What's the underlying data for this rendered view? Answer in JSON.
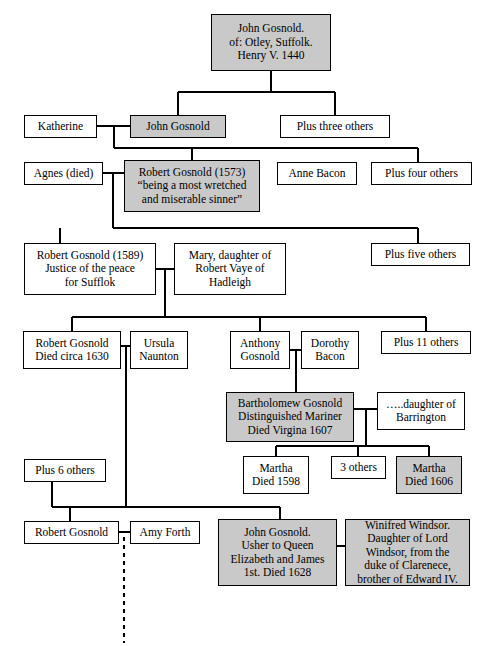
{
  "diagram": {
    "type": "genealogy-tree",
    "shaded_color": "#c9c9c9",
    "plain_color": "#ffffff",
    "line_color": "#000000"
  },
  "nodes": [
    {
      "id": "john-gosnold-1440",
      "name": "john-gosnold-otley-box",
      "lines": [
        "John Gosnold.",
        "of: Otley, Suffolk.",
        "Henry V. 1440"
      ],
      "shaded": true,
      "x": 211,
      "y": 14,
      "w": 120,
      "h": 57
    },
    {
      "id": "katherine",
      "name": "katherine-box",
      "lines": [
        "Katherine"
      ],
      "shaded": false,
      "x": 24,
      "y": 115,
      "w": 73,
      "h": 23
    },
    {
      "id": "john-gosnold-2",
      "name": "john-gosnold-box",
      "lines": [
        "John Gosnold"
      ],
      "shaded": true,
      "x": 130,
      "y": 115,
      "w": 96,
      "h": 23
    },
    {
      "id": "plus-three-others",
      "name": "plus-three-others-box",
      "lines": [
        "Plus three others"
      ],
      "shaded": false,
      "x": 280,
      "y": 115,
      "w": 110,
      "h": 23
    },
    {
      "id": "agnes-died",
      "name": "agnes-died-box",
      "lines": [
        "Agnes (died)"
      ],
      "shaded": false,
      "x": 24,
      "y": 162,
      "w": 79,
      "h": 23
    },
    {
      "id": "robert-gosnold-1573",
      "name": "robert-gosnold-1573-box",
      "lines": [
        "Robert Gosnold (1573)",
        "“being a most wretched",
        "and miserable sinner”"
      ],
      "shaded": true,
      "x": 124,
      "y": 160,
      "w": 136,
      "h": 52
    },
    {
      "id": "anne-bacon",
      "name": "anne-bacon-box",
      "lines": [
        "Anne Bacon"
      ],
      "shaded": false,
      "x": 277,
      "y": 162,
      "w": 80,
      "h": 23
    },
    {
      "id": "plus-four-others",
      "name": "plus-four-others-box",
      "lines": [
        "Plus four others"
      ],
      "shaded": false,
      "x": 371,
      "y": 162,
      "w": 101,
      "h": 23
    },
    {
      "id": "robert-gosnold-1589",
      "name": "robert-gosnold-1589-box",
      "lines": [
        "Robert Gosnold (1589)",
        "Justice of the peace",
        "for Sufflok"
      ],
      "shaded": false,
      "x": 24,
      "y": 243,
      "w": 132,
      "h": 52
    },
    {
      "id": "mary-vaye",
      "name": "mary-daughter-robert-vaye-box",
      "lines": [
        "Mary, daughter of",
        "Robert Vaye of",
        "Hadleigh"
      ],
      "shaded": false,
      "x": 174,
      "y": 243,
      "w": 112,
      "h": 52
    },
    {
      "id": "plus-five-others",
      "name": "plus-five-others-box",
      "lines": [
        "Plus five others"
      ],
      "shaded": false,
      "x": 371,
      "y": 243,
      "w": 99,
      "h": 23
    },
    {
      "id": "robert-gosnold-1630",
      "name": "robert-gosnold-died-circa-1630-box",
      "lines": [
        "Robert Gosnold",
        "Died circa 1630"
      ],
      "shaded": false,
      "x": 23,
      "y": 331,
      "w": 98,
      "h": 38
    },
    {
      "id": "ursula-naunton",
      "name": "ursula-naunton-box",
      "lines": [
        "Ursula",
        "Naunton"
      ],
      "shaded": false,
      "x": 130,
      "y": 331,
      "w": 58,
      "h": 38
    },
    {
      "id": "anthony-gosnold",
      "name": "anthony-gosnold-box",
      "lines": [
        "Anthony",
        "Gosnold"
      ],
      "shaded": false,
      "x": 230,
      "y": 331,
      "w": 60,
      "h": 38
    },
    {
      "id": "dorothy-bacon",
      "name": "dorothy-bacon-box",
      "lines": [
        "Dorothy",
        "Bacon"
      ],
      "shaded": false,
      "x": 301,
      "y": 331,
      "w": 58,
      "h": 38
    },
    {
      "id": "plus-11-others",
      "name": "plus-11-others-box",
      "lines": [
        "Plus 11 others"
      ],
      "shaded": false,
      "x": 381,
      "y": 331,
      "w": 90,
      "h": 23
    },
    {
      "id": "bartholomew-gosnold",
      "name": "bartholomew-gosnold-box",
      "lines": [
        "Bartholomew Gosnold",
        "Distinguished Mariner",
        "Died Virgina 1607"
      ],
      "shaded": true,
      "x": 226,
      "y": 392,
      "w": 128,
      "h": 50
    },
    {
      "id": "daughter-of-barrington",
      "name": "daughter-of-barrington-box",
      "lines": [
        "…..daughter of",
        "Barrington"
      ],
      "shaded": false,
      "x": 377,
      "y": 392,
      "w": 88,
      "h": 38
    },
    {
      "id": "plus-6-others",
      "name": "plus-6-others-box",
      "lines": [
        "Plus 6 others"
      ],
      "shaded": false,
      "x": 24,
      "y": 459,
      "w": 82,
      "h": 23
    },
    {
      "id": "martha-1598",
      "name": "martha-died-1598-box",
      "lines": [
        "Martha",
        "Died 1598"
      ],
      "shaded": false,
      "x": 243,
      "y": 456,
      "w": 66,
      "h": 38
    },
    {
      "id": "three-others",
      "name": "three-others-box",
      "lines": [
        "3 others"
      ],
      "shaded": false,
      "x": 331,
      "y": 456,
      "w": 55,
      "h": 23
    },
    {
      "id": "martha-1606",
      "name": "martha-died-1606-box",
      "lines": [
        "Martha",
        "Died 1606"
      ],
      "shaded": true,
      "x": 396,
      "y": 456,
      "w": 66,
      "h": 38
    },
    {
      "id": "robert-gosnold-bottom",
      "name": "robert-gosnold-bottom-box",
      "lines": [
        "Robert Gosnold"
      ],
      "shaded": false,
      "x": 24,
      "y": 521,
      "w": 95,
      "h": 23
    },
    {
      "id": "amy-forth",
      "name": "amy-forth-box",
      "lines": [
        "Amy Forth"
      ],
      "shaded": false,
      "x": 130,
      "y": 521,
      "w": 70,
      "h": 23
    },
    {
      "id": "john-gosnold-usher",
      "name": "john-gosnold-usher-box",
      "lines": [
        "John Gosnold.",
        "Usher to Queen",
        "Elizabeth and James",
        "1st. Died 1628"
      ],
      "shaded": true,
      "x": 218,
      "y": 519,
      "w": 119,
      "h": 67
    },
    {
      "id": "winifred-windsor",
      "name": "winifred-windsor-box",
      "lines": [
        "Winifred Windsor.",
        "Daughter of Lord",
        "Windsor, from the",
        "duke of Clarenece,",
        "brother of Edward IV."
      ],
      "shaded": true,
      "x": 345,
      "y": 519,
      "w": 125,
      "h": 67
    }
  ],
  "connectors": {
    "note": "orthogonal black lines joining boxes; one dashed descent line below Robert Gosnold / Amy Forth",
    "dashed_descent_label": "dashed-descent-line"
  }
}
